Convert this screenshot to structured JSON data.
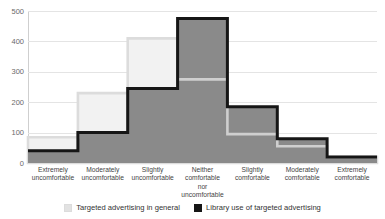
{
  "chart_data": {
    "type": "area",
    "title": "",
    "subtitle": "",
    "xlabel": "",
    "ylabel": "",
    "ylim": [
      0,
      500
    ],
    "yticks": [
      0,
      100,
      200,
      300,
      400,
      500
    ],
    "grid": true,
    "legend_position": "bottom",
    "categories": [
      "Extremely uncomfortable",
      "Moderately uncomfortable",
      "Slightly uncomfortable",
      "Neither comfortable nor uncomfortable",
      "Slightly comfortable",
      "Moderately comfortable",
      "Extremely comfortable"
    ],
    "category_lines": [
      [
        "Extremely",
        "uncomfortable"
      ],
      [
        "Moderately",
        "uncomfortable"
      ],
      [
        "Slightly",
        "uncomfortable"
      ],
      [
        "Neither",
        "comfortable",
        "nor",
        "uncomfortable"
      ],
      [
        "Slightly",
        "comfortable"
      ],
      [
        "Moderately",
        "comfortable"
      ],
      [
        "Extremely",
        "comfortable"
      ]
    ],
    "series": [
      {
        "name": "Targeted advertising in general",
        "color": "#e2e2e2",
        "values": [
          85,
          230,
          410,
          275,
          95,
          55,
          20
        ]
      },
      {
        "name": "Library use of targeted advertising",
        "color": "#161616",
        "values": [
          40,
          100,
          245,
          475,
          185,
          80,
          20
        ]
      }
    ]
  },
  "legend": {
    "items": [
      {
        "label": "Targeted advertising in general"
      },
      {
        "label": "Library use of targeted advertising"
      }
    ]
  },
  "colors": {
    "light_series_fill": "#f2f2f2",
    "light_series_stroke": "#dcdcdc",
    "dark_series_stroke": "#161616",
    "overlap_fill": "#8a8a8a",
    "gridline": "#e4e4e4",
    "axis": "#cfcfcf",
    "tick_text": "#6a6a6a",
    "label_text": "#444444"
  }
}
